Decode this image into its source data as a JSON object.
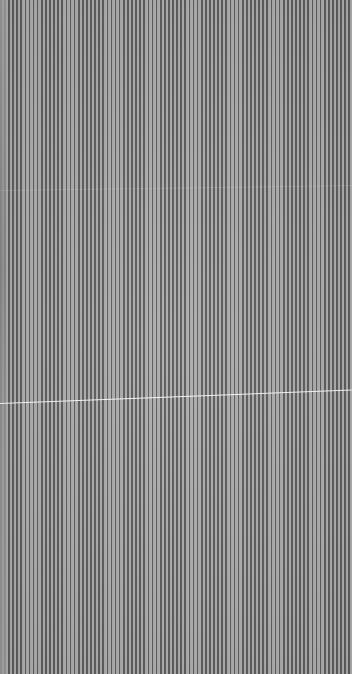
{
  "image": {
    "description": "Dense vertical grey stripe pattern with a thin bright diagonal scratch line",
    "stripe_period_px": 4.1,
    "colors": {
      "dark_stripe": "#5c5c5c",
      "light_stripe": "#acacac",
      "scratch": "#ffffff"
    }
  }
}
